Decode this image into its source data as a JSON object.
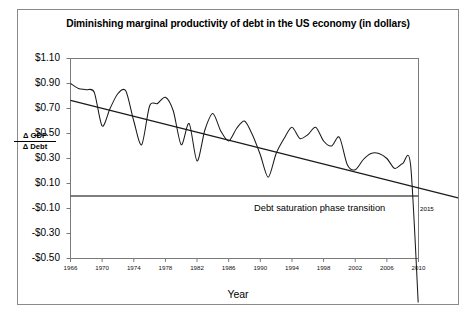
{
  "chart_data": {
    "type": "line",
    "title": "Diminishing marginal productivity of debt in the US economy (in dollars)",
    "xlabel": "Year",
    "ylabel_numerator": "Δ GDP",
    "ylabel_denominator": "Δ Debt",
    "xlim": [
      1966,
      2010
    ],
    "ylim": [
      -0.5,
      1.1
    ],
    "ytick_labels": [
      "$1.10",
      "$0.90",
      "$0.70",
      "$0.50",
      "$0.30",
      "$0.10",
      "-$0.10",
      "-$0.30",
      "-$0.50"
    ],
    "ytick_values": [
      1.1,
      0.9,
      0.7,
      0.5,
      0.3,
      0.1,
      -0.1,
      -0.3,
      -0.5
    ],
    "xtick_labels": [
      "1966",
      "1970",
      "1974",
      "1978",
      "1982",
      "1986",
      "1990",
      "1994",
      "1998",
      "2002",
      "2006",
      "2010"
    ],
    "xtick_values": [
      1966,
      1970,
      1974,
      1978,
      1982,
      1986,
      1990,
      1994,
      1998,
      2002,
      2006,
      2010
    ],
    "grid": false,
    "zero_line": 0.0,
    "legend": null,
    "annotations": [
      {
        "text": "Debt saturation phase transition",
        "x": 1992,
        "y": -0.035
      },
      {
        "text": "2015",
        "x": 2015,
        "y": 0.0
      }
    ],
    "series": [
      {
        "name": "Δ GDP / Δ Debt",
        "color": "#1a1a1a",
        "x": [
          1966,
          1967,
          1968,
          1969,
          1970,
          1971,
          1972,
          1973,
          1974,
          1975,
          1976,
          1977,
          1978,
          1979,
          1980,
          1981,
          1982,
          1983,
          1984,
          1985,
          1986,
          1987,
          1988,
          1989,
          1990,
          1991,
          1992,
          1993,
          1994,
          1995,
          1996,
          1997,
          1998,
          1999,
          2000,
          2001,
          2002,
          2003,
          2004,
          2005,
          2006,
          2007,
          2008,
          2009,
          2010
        ],
        "values": [
          0.9,
          0.86,
          0.85,
          0.83,
          0.56,
          0.7,
          0.82,
          0.84,
          0.6,
          0.41,
          0.72,
          0.74,
          0.79,
          0.68,
          0.41,
          0.58,
          0.28,
          0.53,
          0.66,
          0.52,
          0.44,
          0.54,
          0.6,
          0.49,
          0.33,
          0.15,
          0.34,
          0.46,
          0.55,
          0.46,
          0.49,
          0.55,
          0.44,
          0.4,
          0.47,
          0.25,
          0.21,
          0.29,
          0.34,
          0.34,
          0.3,
          0.22,
          0.26,
          0.25,
          -0.9
        ]
      },
      {
        "name": "linear trend",
        "color": "#1a1a1a",
        "trend": true,
        "x": [
          1966,
          2015
        ],
        "values": [
          0.765,
          -0.015
        ]
      }
    ]
  },
  "figure": {
    "border_color": "#8a8a8a",
    "axis_color": "#7a7a7a",
    "zero_line_color": "#555555"
  }
}
